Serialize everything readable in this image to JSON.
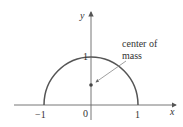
{
  "diagram": {
    "type": "semicircle-center-of-mass",
    "axes": {
      "x_label": "x",
      "y_label": "y",
      "ticks": {
        "x_neg": "−1",
        "origin": "0",
        "x_pos": "1",
        "y_top": "1"
      }
    },
    "annotation": {
      "line1": "center of",
      "line2": "mass"
    },
    "colors": {
      "curve": "#555555",
      "axes": "#555555",
      "text": "#333333"
    }
  }
}
